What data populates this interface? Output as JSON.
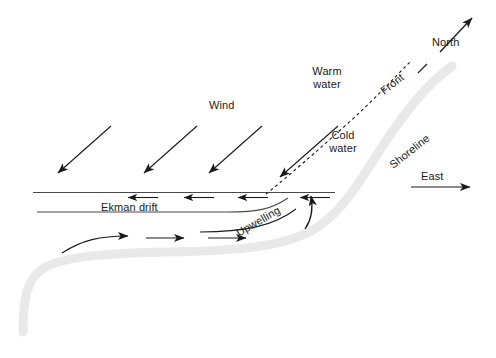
{
  "diagram": {
    "colors": {
      "line": "#1a1a1a",
      "shoreline_band": "#e9e9e9",
      "background": "#ffffff",
      "text": "#1a1a1a"
    },
    "labels": {
      "wind": "Wind",
      "ekman_drift": "Ekman drift",
      "upwelling": "Upwelling",
      "warm_water_line1": "Warm",
      "warm_water_line2": "water",
      "cold_water_line1": "Cold",
      "cold_water_line2": "water",
      "front": "Front",
      "shoreline": "Shoreline",
      "north": "North",
      "east": "East"
    },
    "features": {
      "wind_arrows_count": 4,
      "wind_arrow_direction": "down-left",
      "ekman_arrows_count": 4,
      "ekman_arrow_direction": "left",
      "deep_flow_arrows_count": 3,
      "deep_flow_arrow_direction": "right",
      "upwelling_arrow_direction": "up",
      "front_line_style": "dashed",
      "north_arrow_direction": "up-right",
      "east_arrow_direction": "right"
    }
  }
}
